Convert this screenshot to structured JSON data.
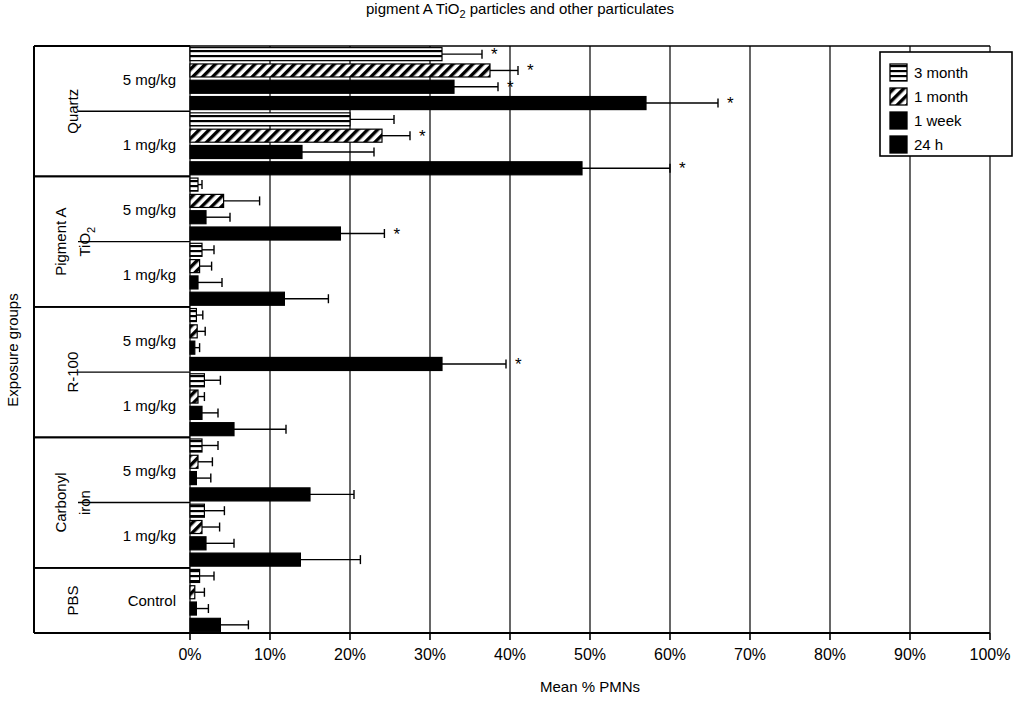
{
  "chart_data": {
    "type": "bar",
    "orientation": "horizontal",
    "title": "pigment A TiO2 particles and other particulates",
    "title_part1": "pigment A TiO",
    "title_sub": "2",
    "title_part2": " particles and other particulates",
    "xlabel": "Mean % PMNs",
    "ylabel": "Exposure groups",
    "xlim": [
      0,
      100
    ],
    "xticks": [
      "0%",
      "10%",
      "20%",
      "30%",
      "40%",
      "50%",
      "60%",
      "70%",
      "80%",
      "90%",
      "100%"
    ],
    "xtick_values": [
      0,
      10,
      20,
      30,
      40,
      50,
      60,
      70,
      80,
      90,
      100
    ],
    "grid": true,
    "legend_position": "top-right",
    "series": [
      {
        "name": "3 month",
        "pattern": "horizontal-lines"
      },
      {
        "name": "1 month",
        "pattern": "diagonal-hatch"
      },
      {
        "name": "1 week",
        "pattern": "solid-black"
      },
      {
        "name": "24 h",
        "pattern": "solid-black"
      }
    ],
    "groups": [
      {
        "group": "Quartz",
        "rows": [
          {
            "dose": "5 mg/kg",
            "bars": [
              {
                "series": "3 month",
                "value": 31.5,
                "error": 5.0,
                "significant": true
              },
              {
                "series": "1 month",
                "value": 37.5,
                "error": 3.5,
                "significant": true
              },
              {
                "series": "1 week",
                "value": 33.0,
                "error": 5.5,
                "significant": true
              },
              {
                "series": "24 h",
                "value": 57.0,
                "error": 9.0,
                "significant": true
              }
            ]
          },
          {
            "dose": "1 mg/kg",
            "bars": [
              {
                "series": "3 month",
                "value": 20.0,
                "error": 5.5,
                "significant": false
              },
              {
                "series": "1 month",
                "value": 24.0,
                "error": 3.5,
                "significant": true
              },
              {
                "series": "1 week",
                "value": 14.0,
                "error": 9.0,
                "significant": false
              },
              {
                "series": "24 h",
                "value": 49.0,
                "error": 11.0,
                "significant": true
              }
            ]
          }
        ]
      },
      {
        "group": "Pigment A TiO2",
        "group_part1": "Pigment A",
        "group_part2": "TiO",
        "group_sub": "2",
        "rows": [
          {
            "dose": "5 mg/kg",
            "bars": [
              {
                "series": "3 month",
                "value": 1.0,
                "error": 0.5,
                "significant": false
              },
              {
                "series": "1 month",
                "value": 4.2,
                "error": 4.5,
                "significant": false
              },
              {
                "series": "1 week",
                "value": 2.0,
                "error": 3.0,
                "significant": false
              },
              {
                "series": "24 h",
                "value": 18.8,
                "error": 5.5,
                "significant": true
              }
            ]
          },
          {
            "dose": "1 mg/kg",
            "bars": [
              {
                "series": "3 month",
                "value": 1.5,
                "error": 1.5,
                "significant": false
              },
              {
                "series": "1 month",
                "value": 1.2,
                "error": 1.5,
                "significant": false
              },
              {
                "series": "1 week",
                "value": 1.0,
                "error": 3.0,
                "significant": false
              },
              {
                "series": "24 h",
                "value": 11.8,
                "error": 5.5,
                "significant": false
              }
            ]
          }
        ]
      },
      {
        "group": "R-100",
        "rows": [
          {
            "dose": "5 mg/kg",
            "bars": [
              {
                "series": "3 month",
                "value": 0.8,
                "error": 0.8,
                "significant": false
              },
              {
                "series": "1 month",
                "value": 0.9,
                "error": 1.0,
                "significant": false
              },
              {
                "series": "1 week",
                "value": 0.6,
                "error": 0.6,
                "significant": false
              },
              {
                "series": "24 h",
                "value": 31.5,
                "error": 8.0,
                "significant": true
              }
            ]
          },
          {
            "dose": "1 mg/kg",
            "bars": [
              {
                "series": "3 month",
                "value": 1.8,
                "error": 2.0,
                "significant": false
              },
              {
                "series": "1 month",
                "value": 1.0,
                "error": 0.8,
                "significant": false
              },
              {
                "series": "1 week",
                "value": 1.5,
                "error": 2.0,
                "significant": false
              },
              {
                "series": "24 h",
                "value": 5.5,
                "error": 6.5,
                "significant": false
              }
            ]
          }
        ]
      },
      {
        "group": "Carbonyl iron",
        "group_part1": "Carbonyl",
        "group_part2": "iron",
        "rows": [
          {
            "dose": "5 mg/kg",
            "bars": [
              {
                "series": "3 month",
                "value": 1.5,
                "error": 2.0,
                "significant": false
              },
              {
                "series": "1 month",
                "value": 1.0,
                "error": 1.8,
                "significant": false
              },
              {
                "series": "1 week",
                "value": 0.8,
                "error": 1.8,
                "significant": false
              },
              {
                "series": "24 h",
                "value": 15.0,
                "error": 5.5,
                "significant": false
              }
            ]
          },
          {
            "dose": "1 mg/kg",
            "bars": [
              {
                "series": "3 month",
                "value": 1.8,
                "error": 2.5,
                "significant": false
              },
              {
                "series": "1 month",
                "value": 1.5,
                "error": 2.2,
                "significant": false
              },
              {
                "series": "1 week",
                "value": 2.0,
                "error": 3.5,
                "significant": false
              },
              {
                "series": "24 h",
                "value": 13.8,
                "error": 7.5,
                "significant": false
              }
            ]
          }
        ]
      },
      {
        "group": "PBS",
        "rows": [
          {
            "dose": "Control",
            "bars": [
              {
                "series": "3 month",
                "value": 1.2,
                "error": 1.8,
                "significant": false
              },
              {
                "series": "1 month",
                "value": 0.6,
                "error": 1.2,
                "significant": false
              },
              {
                "series": "1 week",
                "value": 0.8,
                "error": 1.5,
                "significant": false
              },
              {
                "series": "24 h",
                "value": 3.8,
                "error": 3.5,
                "significant": false
              }
            ]
          }
        ]
      }
    ]
  },
  "legend": {
    "items": [
      {
        "label": "3 month"
      },
      {
        "label": "1 month"
      },
      {
        "label": "1 week"
      },
      {
        "label": "24 h"
      }
    ]
  },
  "axes": {
    "x_title": "Mean % PMNs",
    "y_title": "Exposure groups"
  },
  "annotations": {
    "significance_marker": "*"
  }
}
